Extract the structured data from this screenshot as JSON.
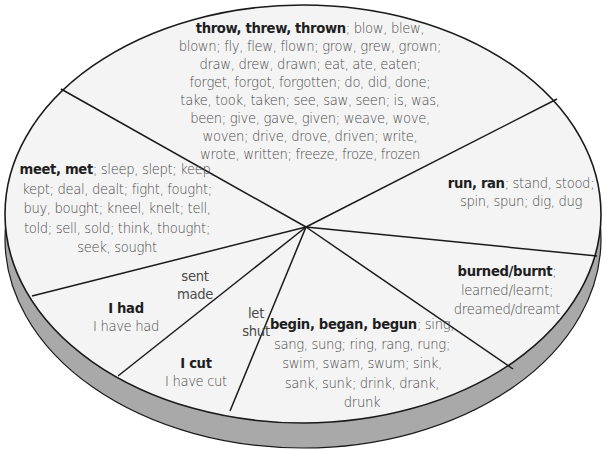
{
  "diagram": {
    "type": "segmented-wheel",
    "colors": {
      "face": "#f4f4f4",
      "rim": "#a9a9a9",
      "outline": "#1a1a1a",
      "bold_text": "#1e1e1e",
      "text": "#4a4a4a"
    },
    "segments": [
      {
        "id": "top",
        "bold": "throw, threw, thrown",
        "rest": "; blow, blew, blown; fly, flew, flown; grow, grew, grown; draw, drew, drawn; eat, ate, eaten; forget, forgot, forgotten; do, did, done; take, took, taken; see, saw, seen; is, was, been; give, gave, given; weave, wove, woven; drive, drove, driven; write, wrote, written; freeze, froze, frozen",
        "lines": [
          [
            "throw, threw, thrown",
            "; blow, blew,"
          ],
          [
            "",
            "blown; fly, flew, flown; grow, grew, grown;"
          ],
          [
            "",
            "draw, drew, drawn; eat, ate, eaten;"
          ],
          [
            "",
            "forget, forgot, forgotten; do, did, done;"
          ],
          [
            "",
            "take, took, taken; see, saw, seen; is, was,"
          ],
          [
            "",
            "been; give, gave, given; weave, wove,"
          ],
          [
            "",
            "woven; drive, drove, driven; write,"
          ],
          [
            "",
            "wrote, written; freeze, froze, frozen"
          ]
        ]
      },
      {
        "id": "right",
        "lines": [
          [
            "run, ran",
            "; stand, stood;"
          ],
          [
            "",
            "spin, spun; dig, dug"
          ]
        ]
      },
      {
        "id": "lower-right",
        "lines": [
          [
            "burned/burnt",
            ";"
          ],
          [
            "",
            "learned/learnt;"
          ],
          [
            "",
            "dreamed/dreamt"
          ]
        ]
      },
      {
        "id": "bottom",
        "lines": [
          [
            "begin, began, begun",
            "; sing,"
          ],
          [
            "",
            "sang, sung; ring, rang, rung;"
          ],
          [
            "",
            "swim, swam, swum; sink,"
          ],
          [
            "",
            "sank, sunk; drink, drank,"
          ],
          [
            "",
            "drunk"
          ]
        ]
      },
      {
        "id": "lower-left-cut",
        "lines": [
          [
            "I cut",
            ""
          ],
          [
            "",
            "I have cut"
          ]
        ],
        "examples": [
          "let",
          "shut"
        ]
      },
      {
        "id": "left-had",
        "lines": [
          [
            "I had",
            ""
          ],
          [
            "",
            "I have had"
          ]
        ],
        "examples": [
          "sent",
          "made"
        ]
      },
      {
        "id": "left",
        "lines": [
          [
            "meet, met",
            "; sleep, slept; keep,"
          ],
          [
            "",
            "kept; deal, dealt; fight, fought;"
          ],
          [
            "",
            "buy, bought; kneel, knelt; tell,"
          ],
          [
            "",
            "told; sell, sold; think, thought;"
          ],
          [
            "",
            "seek, sought"
          ]
        ]
      }
    ]
  }
}
